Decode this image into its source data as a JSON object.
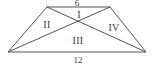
{
  "figure": {
    "type": "geometry-diagram",
    "shape": "trapezoid",
    "stroke_color": "#555555",
    "text_color": "#3a3a3a",
    "background_color": "#ffffff",
    "stroke_width": 1,
    "vertices": {
      "top_left": {
        "x": 47,
        "y": 7
      },
      "top_right": {
        "x": 110,
        "y": 7
      },
      "bottom_right": {
        "x": 146,
        "y": 52
      },
      "bottom_left": {
        "x": 8,
        "y": 52
      },
      "diagonal_intersection": {
        "x": 78,
        "y": 24
      }
    },
    "side_labels": [
      {
        "name": "top-side-length",
        "text": "6",
        "x": 77,
        "y": 3
      },
      {
        "name": "bottom-side-length",
        "text": "12",
        "x": 78,
        "y": 60
      }
    ],
    "region_labels": [
      {
        "name": "region-one",
        "text": "I",
        "x": 79,
        "y": 15
      },
      {
        "name": "region-two",
        "text": "II",
        "x": 47,
        "y": 25
      },
      {
        "name": "region-three",
        "text": "III",
        "x": 78,
        "y": 41
      },
      {
        "name": "region-four",
        "text": "IV",
        "x": 114,
        "y": 28
      }
    ]
  }
}
